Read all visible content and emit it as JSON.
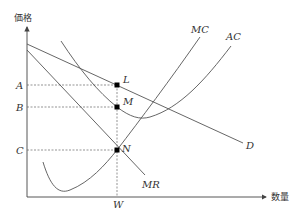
{
  "axes": {
    "y_label": "価格",
    "x_label": "数量"
  },
  "curves": {
    "mc": "MC",
    "ac": "AC",
    "d": "D",
    "mr": "MR"
  },
  "points": {
    "l": "L",
    "m": "M",
    "n": "N"
  },
  "price_levels": {
    "a": "A",
    "b": "B",
    "c": "C"
  },
  "quantity_level": {
    "w": "W"
  },
  "colors": {
    "line": "#555555",
    "point": "#000000",
    "text": "#333333"
  }
}
